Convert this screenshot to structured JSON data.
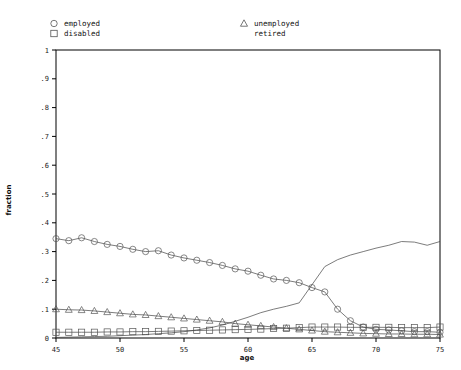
{
  "chart_data": {
    "type": "line",
    "title": "",
    "xlabel": "age",
    "ylabel": "fraction",
    "xlim": [
      45,
      75
    ],
    "ylim": [
      0,
      1
    ],
    "grid": false,
    "legend_position": "above-plot",
    "x_ticks": [
      "45",
      "50",
      "55",
      "60",
      "65",
      "70",
      "75"
    ],
    "x_tick_values": [
      45,
      50,
      55,
      60,
      65,
      70,
      75
    ],
    "y_ticks": [
      "0",
      ".1",
      ".2",
      ".3",
      ".4",
      ".5",
      ".6",
      ".7",
      ".8",
      ".9",
      "1"
    ],
    "y_tick_values": [
      0,
      0.1,
      0.2,
      0.3,
      0.4,
      0.5,
      0.6,
      0.7,
      0.8,
      0.9,
      1
    ],
    "x": [
      45,
      46,
      47,
      48,
      49,
      50,
      51,
      52,
      53,
      54,
      55,
      56,
      57,
      58,
      59,
      60,
      61,
      62,
      63,
      64,
      65,
      66,
      67,
      68,
      69,
      70,
      71,
      72,
      73,
      74,
      75
    ],
    "series": [
      {
        "name": "employed",
        "marker": "circle",
        "values": [
          0.345,
          0.338,
          0.348,
          0.335,
          0.325,
          0.318,
          0.308,
          0.3,
          0.303,
          0.288,
          0.278,
          0.27,
          0.262,
          0.252,
          0.24,
          0.232,
          0.218,
          0.205,
          0.2,
          0.192,
          0.175,
          0.16,
          0.1,
          0.06,
          0.038,
          0.03,
          0.028,
          0.025,
          0.022,
          0.022,
          0.02
        ]
      },
      {
        "name": "disabled",
        "marker": "square",
        "values": [
          0.02,
          0.02,
          0.02,
          0.02,
          0.021,
          0.021,
          0.022,
          0.022,
          0.023,
          0.024,
          0.025,
          0.026,
          0.027,
          0.028,
          0.029,
          0.03,
          0.031,
          0.033,
          0.034,
          0.036,
          0.038,
          0.038,
          0.038,
          0.037,
          0.037,
          0.037,
          0.037,
          0.036,
          0.036,
          0.036,
          0.038
        ]
      },
      {
        "name": "unemployed",
        "marker": "triangle",
        "values": [
          0.1,
          0.098,
          0.097,
          0.094,
          0.09,
          0.086,
          0.082,
          0.08,
          0.076,
          0.072,
          0.068,
          0.064,
          0.06,
          0.056,
          0.05,
          0.046,
          0.042,
          0.038,
          0.034,
          0.03,
          0.026,
          0.022,
          0.02,
          0.018,
          0.016,
          0.015,
          0.014,
          0.014,
          0.013,
          0.013,
          0.012
        ]
      },
      {
        "name": "retired",
        "marker": "none",
        "values": [
          0.002,
          0.003,
          0.004,
          0.005,
          0.006,
          0.008,
          0.01,
          0.012,
          0.015,
          0.018,
          0.022,
          0.028,
          0.035,
          0.045,
          0.058,
          0.072,
          0.088,
          0.1,
          0.11,
          0.122,
          0.185,
          0.248,
          0.272,
          0.288,
          0.3,
          0.312,
          0.322,
          0.335,
          0.333,
          0.322,
          0.335
        ]
      }
    ]
  },
  "legend": {
    "entries": [
      {
        "label": "employed",
        "marker": "circle",
        "column": 0,
        "row": 0
      },
      {
        "label": "disabled",
        "marker": "square",
        "column": 0,
        "row": 1
      },
      {
        "label": "unemployed",
        "marker": "triangle",
        "column": 1,
        "row": 0
      },
      {
        "label": "retired",
        "marker": "none",
        "column": 1,
        "row": 1
      }
    ]
  },
  "colors": {
    "line": "#444444",
    "marker": "#555555",
    "axis": "#000000",
    "text": "#111111",
    "background": "#ffffff"
  }
}
